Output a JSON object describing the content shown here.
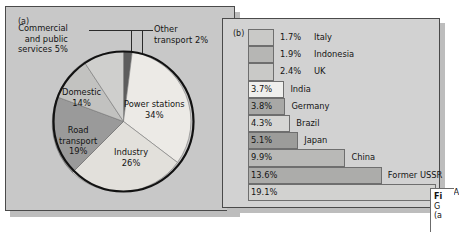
{
  "figure": {
    "panel_a_tag": "(a)",
    "panel_b_tag": "(b)",
    "caption_lines": [
      "Fi",
      "G",
      "(a"
    ]
  },
  "chart_data": [
    {
      "type": "pie",
      "title": "",
      "panel": "(a)",
      "categories": [
        "Power stations",
        "Industry",
        "Road transport",
        "Domestic",
        "Commercial and public services",
        "Other transport"
      ],
      "values": [
        34,
        26,
        19,
        14,
        5,
        2
      ],
      "value_labels": [
        "34%",
        "26%",
        "19%",
        "14%",
        "5%",
        "2%"
      ],
      "colors": [
        "#eceae6",
        "#e2e0db",
        "#9a9a9a",
        "#c2c2c0",
        "#cfcfcd",
        "#5d5d5d"
      ],
      "slices": [
        {
          "label": "Power stations",
          "label_line1": "Power stations",
          "label_line2": "34%",
          "value": 34,
          "color": "#eceae6"
        },
        {
          "label": "Industry",
          "label_line1": "Industry",
          "label_line2": "26%",
          "value": 26,
          "color": "#e2e0db"
        },
        {
          "label": "Road transport",
          "label_line1": "Road",
          "label_line2": "transport",
          "label_line3": "19%",
          "value": 19,
          "color": "#9a9a9a"
        },
        {
          "label": "Domestic",
          "label_line1": "Domestic",
          "label_line2": "14%",
          "value": 14,
          "color": "#c2c2c0"
        },
        {
          "label": "Commercial and public services",
          "label_line1": "Commercial",
          "label_line2": "and public",
          "label_line3": "services 5%",
          "value": 5,
          "color": "#cfcfcd"
        },
        {
          "label": "Other transport",
          "label_line1": "Other",
          "label_line2": "transport 2%",
          "value": 2,
          "color": "#5d5d5d"
        }
      ],
      "legend": "none",
      "grid": false
    },
    {
      "type": "bar",
      "orientation": "horizontal",
      "panel": "(b)",
      "title": "",
      "xlabel": "",
      "ylabel": "",
      "xlim": [
        0,
        19.1
      ],
      "grid": false,
      "legend": "none",
      "categories": [
        "Italy",
        "Indonesia",
        "UK",
        "India",
        "Germany",
        "Brazil",
        "Japan",
        "China",
        "Former USSR",
        "USA"
      ],
      "values": [
        1.7,
        1.9,
        2.4,
        3.7,
        3.8,
        4.3,
        5.1,
        9.9,
        13.6,
        19.1
      ],
      "value_labels": [
        "1.7%",
        "1.9%",
        "2.4%",
        "3.7%",
        "3.8%",
        "4.3%",
        "5.1%",
        "9.9%",
        "13.6%",
        "19.1%"
      ],
      "bars": [
        {
          "name": "Italy",
          "value": 1.7,
          "value_label": "1.7%",
          "color": "#c9c9c7",
          "label_inside": false
        },
        {
          "name": "Indonesia",
          "value": 1.9,
          "value_label": "1.9%",
          "color": "#b6b6b4",
          "label_inside": false
        },
        {
          "name": "UK",
          "value": 2.4,
          "value_label": "2.4%",
          "color": "#c9c9c7",
          "label_inside": false
        },
        {
          "name": "India",
          "value": 3.7,
          "value_label": "3.7%",
          "color": "#efefed",
          "label_inside": true
        },
        {
          "name": "Germany",
          "value": 3.8,
          "value_label": "3.8%",
          "color": "#a8a8a6",
          "label_inside": true
        },
        {
          "name": "Brazil",
          "value": 4.3,
          "value_label": "4.3%",
          "color": "#d6d6d4",
          "label_inside": true
        },
        {
          "name": "Japan",
          "value": 5.1,
          "value_label": "5.1%",
          "color": "#9c9c9a",
          "label_inside": true
        },
        {
          "name": "China",
          "value": 9.9,
          "value_label": "9.9%",
          "color": "#b9b9b7",
          "label_inside": true
        },
        {
          "name": "Former USSR",
          "value": 13.6,
          "value_label": "13.6%",
          "color": "#acacaa",
          "label_inside": true
        },
        {
          "name": "USA",
          "value": 19.1,
          "value_label": "19.1%",
          "color": "#d2d2d0",
          "label_inside": true
        }
      ]
    }
  ]
}
